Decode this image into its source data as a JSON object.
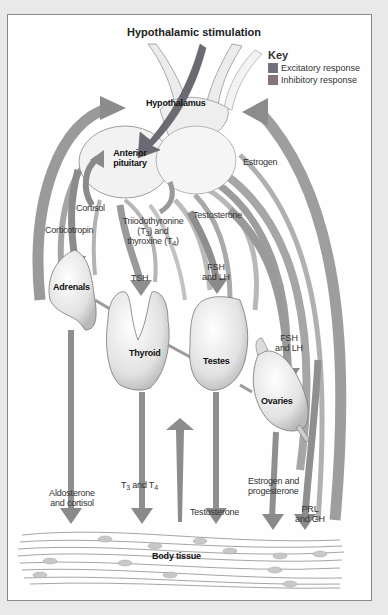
{
  "diagram": {
    "title": "Hypothalamic stimulation",
    "key": {
      "title": "Key",
      "items": [
        {
          "label": "Excitatory response",
          "color": "#6f6f7c"
        },
        {
          "label": "Inhibitory response",
          "color": "#8a7377"
        }
      ]
    },
    "organs": {
      "hypothalamus": "Hypothalamus",
      "pituitary_line1": "Anterior",
      "pituitary_line2": "pituitary",
      "adrenals": "Adrenals",
      "thyroid": "Thyroid",
      "testes": "Testes",
      "ovaries": "Ovaries",
      "body_tissue": "Body tissue"
    },
    "hormones": {
      "estrogen": "Estrogen",
      "cortisol": "Cortisol",
      "corticotropin": "Corticotropin",
      "t3t4_line1": "Triiodothyronine",
      "t3t4_line2a": "(T",
      "t3t4_line2sub": "3",
      "t3t4_line2b": ") and",
      "t3t4_line3a": "thyroxine (T",
      "t3t4_line3sub": "4",
      "t3t4_line3b": ")",
      "testosterone_upper": "Testosterone",
      "tsh": "TSH",
      "fsh_lh_1_line1": "FSH",
      "fsh_lh_1_line2": "and LH",
      "fsh_lh_2_line1": "FSH",
      "fsh_lh_2_line2": "and LH",
      "aldosterone_line1": "Aldosterone",
      "aldosterone_line2": "and cortisol",
      "t3_t4_a": "T",
      "t3_t4_sub3": "3",
      "t3_t4_mid": " and T",
      "t3_t4_sub4": "4",
      "testosterone_lower": "Testosterone",
      "estrogen_prog_line1": "Estrogen and",
      "estrogen_prog_line2": "progesterone",
      "prl_gh_line1": "PRL",
      "prl_gh_line2": "and GH"
    }
  }
}
